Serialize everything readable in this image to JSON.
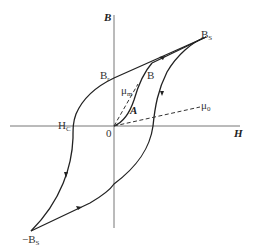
{
  "diagram": {
    "title": "",
    "type": "hysteresis-loop",
    "axes": {
      "x_label": "H",
      "y_label": "B",
      "origin_label": "0"
    },
    "points": {
      "saturation_pos": {
        "label": "B",
        "sub": "S"
      },
      "saturation_neg": {
        "label": "−B",
        "sub": "S"
      },
      "remanence": {
        "label": "B",
        "sub": "r"
      },
      "coercivity": {
        "label": "H",
        "sub": "C"
      },
      "working_point": {
        "label": "B"
      },
      "initial_curve_point": {
        "label": "A"
      }
    },
    "lines": {
      "max_permeability": {
        "label": "μ",
        "sub": "m"
      },
      "initial_permeability": {
        "label": "μ",
        "sub": "0"
      }
    },
    "colors": {
      "curve": "#222222",
      "axis": "#666666",
      "background": "#ffffff"
    }
  }
}
